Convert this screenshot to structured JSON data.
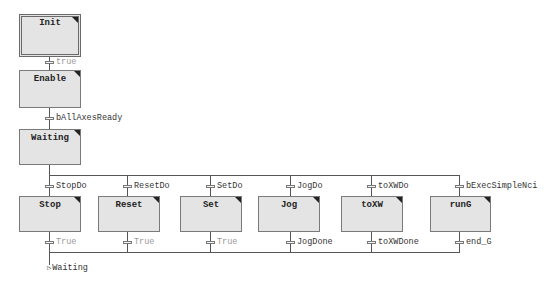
{
  "diagram": {
    "type": "SFC",
    "colors": {
      "step_fill": "#e4e4e4",
      "step_border": "#7a7a7a",
      "line": "#555555",
      "label": "#333333",
      "label_dim": "#999999"
    },
    "steps": {
      "init": "Init",
      "enable": "Enable",
      "waiting": "Waiting",
      "stop": "Stop",
      "reset": "Reset",
      "set": "Set",
      "jog": "Jog",
      "toxw": "toXW",
      "rung": "runG"
    },
    "transitions": {
      "init_to_enable": "true",
      "enable_to_waiting": "bAllAxesReady",
      "branch_in": {
        "stop": "StopDo",
        "reset": "ResetDo",
        "set": "SetDo",
        "jog": "JogDo",
        "toxw": "toXWDo",
        "rung": "bExecSimpleNci"
      },
      "branch_out": {
        "stop": "True",
        "reset": "True",
        "set": "True",
        "jog": "JogDone",
        "toxw": "toXWDone",
        "rung": "end_G"
      }
    },
    "jump_target": "Waiting"
  }
}
